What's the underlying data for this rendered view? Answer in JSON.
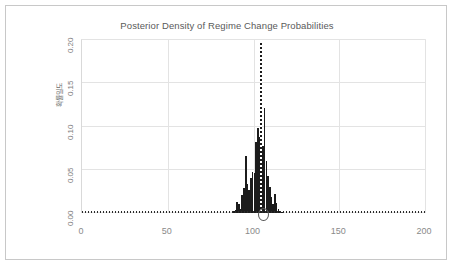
{
  "chart_data": {
    "type": "bar",
    "title": "Posterior Density of Regime Change Probabilities",
    "xlabel": "",
    "ylabel": "확률밀도",
    "xlim": [
      0,
      200
    ],
    "ylim": [
      0.0,
      0.2
    ],
    "xticks": [
      "0",
      "50",
      "100",
      "150",
      "200"
    ],
    "xtick_values": [
      0,
      50,
      100,
      150,
      200
    ],
    "yticks": [
      "0.00",
      "0.05",
      "0.10",
      "0.15",
      "0.20"
    ],
    "ytick_values": [
      0.0,
      0.05,
      0.1,
      0.15,
      0.2
    ],
    "grid": true,
    "legend": null,
    "bar_color": "#1c1c1c",
    "grid_color": "#e3e3e3",
    "bin_width": 1,
    "x": [
      88,
      89,
      90,
      91,
      92,
      93,
      94,
      95,
      96,
      97,
      98,
      99,
      100,
      101,
      102,
      103,
      104,
      105,
      106,
      107,
      108,
      109,
      110,
      111,
      112,
      113,
      114,
      115,
      116
    ],
    "values": [
      0.002,
      0.004,
      0.013,
      0.01,
      0.005,
      0.021,
      0.029,
      0.066,
      0.033,
      0.027,
      0.04,
      0.047,
      0.046,
      0.082,
      0.098,
      0.088,
      0.09,
      0.078,
      0.121,
      0.06,
      0.043,
      0.03,
      0.018,
      0.01,
      0.022,
      0.012,
      0.005,
      0.002,
      0.001
    ],
    "annotations": [
      {
        "name": "peak-reference-line",
        "type": "vline",
        "x": 104,
        "y_top": 0.197,
        "style": "dotted",
        "color": "#1c1c1c"
      },
      {
        "name": "posterior-mode-marker",
        "type": "circle",
        "x": 105,
        "y": 0.0,
        "color": "#555555"
      },
      {
        "name": "zero-density-baseline",
        "type": "hline",
        "y": 0.0,
        "style": "dotted",
        "color": "#2b2b2b"
      }
    ]
  },
  "frame": {
    "border_color": "#c8c8c8",
    "background": "#ffffff"
  }
}
